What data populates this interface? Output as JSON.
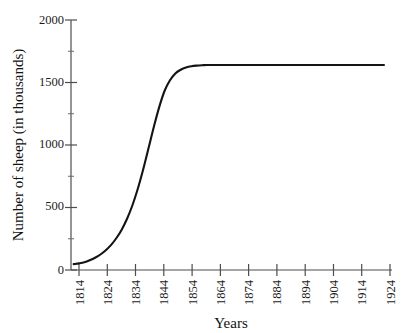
{
  "chart_data": {
    "type": "line",
    "title": "",
    "subtitle": "",
    "xlabel": "Years",
    "ylabel": "Number of sheep (in thousands)",
    "xlim": [
      1809,
      1929
    ],
    "ylim": [
      0,
      2000
    ],
    "grid": false,
    "legend": false,
    "legend_position": "none",
    "x_tick_labels": [
      "1814",
      "1824",
      "1834",
      "1844",
      "1854",
      "1864",
      "1874",
      "1884",
      "1894",
      "1904",
      "1914",
      "1924"
    ],
    "x_ticks": [
      1814,
      1824,
      1834,
      1844,
      1854,
      1864,
      1874,
      1884,
      1894,
      1904,
      1914,
      1924
    ],
    "y_tick_labels": [
      "0",
      "500",
      "1000",
      "1500",
      "2000"
    ],
    "y_ticks": [
      0,
      500,
      1000,
      1500,
      2000
    ],
    "y_minor_ticks": [
      250,
      750,
      1250,
      1750
    ],
    "series_color": "#141414",
    "axis_color": "#4d4d4d",
    "curve_model": "logistic",
    "carrying_capacity": 1640,
    "inflection_year": 1837,
    "growth_rate": 0.22,
    "series": [
      {
        "name": "Sheep population",
        "x": [
          1810,
          1812,
          1814,
          1816,
          1818,
          1820,
          1822,
          1824,
          1826,
          1828,
          1830,
          1832,
          1834,
          1836,
          1838,
          1840,
          1842,
          1844,
          1846,
          1848,
          1850,
          1852,
          1854,
          1856,
          1858,
          1860,
          1864,
          1870,
          1880,
          1890,
          1900,
          1910,
          1920,
          1926
        ],
        "values": [
          47,
          53,
          62,
          78,
          98,
          124,
          158,
          201,
          256,
          325,
          412,
          520,
          652,
          806,
          976,
          1148,
          1305,
          1434,
          1518,
          1573,
          1602,
          1620,
          1630,
          1635,
          1638,
          1640,
          1640,
          1640,
          1640,
          1640,
          1640,
          1640,
          1640,
          1640
        ]
      }
    ]
  },
  "axes": {
    "y_title": "Number of sheep (in thousands)",
    "x_title": "Years"
  }
}
